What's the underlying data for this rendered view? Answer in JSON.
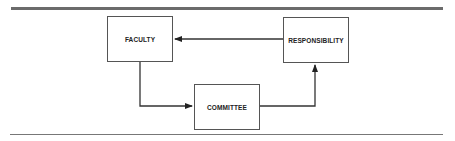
{
  "diagram": {
    "nodes": [
      {
        "id": "faculty",
        "label": "FACULTY"
      },
      {
        "id": "committee",
        "label": "COMMITTEE"
      },
      {
        "id": "responsibility",
        "label": "RESPONSIBILITY"
      }
    ],
    "edges": [
      {
        "from": "responsibility",
        "to": "faculty"
      },
      {
        "from": "faculty",
        "to": "committee"
      },
      {
        "from": "committee",
        "to": "responsibility"
      }
    ]
  }
}
